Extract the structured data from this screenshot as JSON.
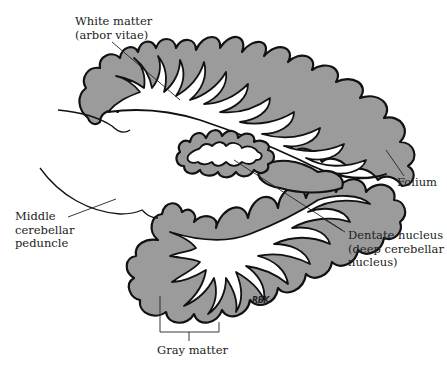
{
  "figure": {
    "colors": {
      "gray_matter": "#9b9b9b",
      "white_matter": "#ffffff",
      "outline": "#111111",
      "background": "#ffffff"
    },
    "labels": {
      "white_matter": "White matter\n(arbor vitae)",
      "folium": "Folium",
      "middle_peduncle": "Middle\ncerebellar\npeduncle",
      "dentate": "Dentate nucleus\n(deep cerebellar\nnucleus)",
      "gray_matter": "Gray matter"
    },
    "signature": "RBK"
  }
}
